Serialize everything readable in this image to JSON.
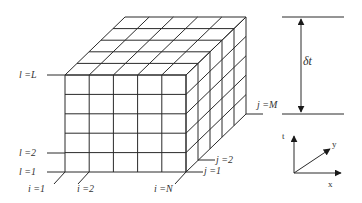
{
  "diagram": {
    "grid": {
      "i_divisions": 5,
      "j_divisions": 5,
      "l_divisions": 5
    },
    "labels": {
      "l_top": "l =L",
      "l_2": "l =2",
      "l_1": "l =1",
      "i_1": "i =1",
      "i_2": "i =2",
      "i_N": "i =N",
      "j_1": "j =1",
      "j_2": "j =2",
      "j_M": "j =M",
      "delta_t": "δt"
    },
    "axes": {
      "t": "t",
      "x": "x",
      "y": "y"
    },
    "colors": {
      "line": "#2a2a2a",
      "text": "#333333",
      "background": "#ffffff"
    }
  }
}
